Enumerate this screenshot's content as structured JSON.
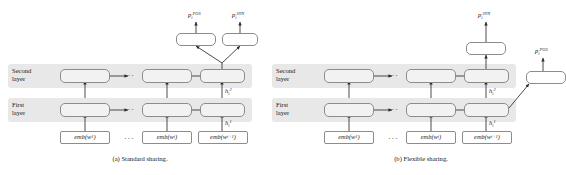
{
  "figure": {
    "background": "#ffffff",
    "band_color": "#e8e8e8",
    "cell_fill": "#f2f2f2",
    "stroke_color": "#8c8c8c",
    "text_color": "#1a1a1a"
  },
  "panels": [
    {
      "id": "a",
      "caption": "(a) Standard sharing.",
      "layer_labels": {
        "second_line1": "Second",
        "second_line2": "layer",
        "first_line1": "First",
        "first_line2": "layer"
      },
      "ellipsis": "···",
      "embeddings": [
        {
          "prefix": "emb(w",
          "sub": "1",
          "suffix": ")"
        },
        {
          "prefix": "emb(w",
          "sub": "i",
          "suffix": ")"
        },
        {
          "prefix": "emb(w",
          "sub": "i+1",
          "suffix": ")"
        }
      ],
      "hidden_labels": [
        {
          "base": "h",
          "sub": "i",
          "sup": "2"
        },
        {
          "base": "h",
          "sub": "i",
          "sup": "1"
        }
      ],
      "outputs": [
        {
          "base": "p",
          "sub": "i",
          "sup": "POS"
        },
        {
          "base": "p",
          "sub": "i",
          "sup": "SYN"
        }
      ]
    },
    {
      "id": "b",
      "caption": "(b) Flexible sharing.",
      "layer_labels": {
        "second_line1": "Second",
        "second_line2": "layer",
        "first_line1": "First",
        "first_line2": "layer"
      },
      "ellipsis": "···",
      "embeddings": [
        {
          "prefix": "emb(w",
          "sub": "1",
          "suffix": ")"
        },
        {
          "prefix": "emb(w",
          "sub": "i",
          "suffix": ")"
        },
        {
          "prefix": "emb(w",
          "sub": "i+1",
          "suffix": ")"
        }
      ],
      "hidden_labels": [
        {
          "base": "h",
          "sub": "i",
          "sup": "2"
        },
        {
          "base": "h",
          "sub": "i",
          "sup": "1"
        }
      ],
      "outputs": [
        {
          "base": "p",
          "sub": "i",
          "sup": "SYN"
        },
        {
          "base": "p",
          "sub": "i",
          "sup": "POS"
        }
      ]
    }
  ]
}
